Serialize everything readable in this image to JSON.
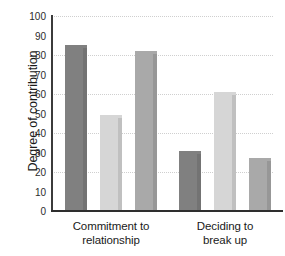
{
  "chart_data": {
    "type": "bar",
    "title": "",
    "xlabel": "",
    "ylabel": "Degree of contribution",
    "ylim": [
      0,
      100
    ],
    "ytick_step": 10,
    "yticks": [
      100,
      90,
      80,
      70,
      60,
      50,
      40,
      30,
      20,
      10,
      0
    ],
    "gridlines": "horizontal dotted every 20 units",
    "legend": "none",
    "categories": [
      "Commitment to relationship",
      "Deciding to break up"
    ],
    "category_lines": [
      [
        "Commitment to",
        "relationship"
      ],
      [
        "Deciding to",
        "break up"
      ]
    ],
    "series": [
      {
        "name": "series-1",
        "color": "#808080",
        "values": [
          85,
          31
        ]
      },
      {
        "name": "series-2",
        "color": "#d6d6d6",
        "values": [
          49,
          61
        ]
      },
      {
        "name": "series-3",
        "color": "#a9a9a9",
        "values": [
          82,
          27
        ]
      }
    ],
    "colors": {
      "series_1": "#808080",
      "series_2": "#d6d6d6",
      "series_3": "#a9a9a9",
      "axis": "#2e2e2e",
      "gridline": "#cfcfcf",
      "text": "#1a1a1a",
      "background": "#ffffff"
    }
  }
}
